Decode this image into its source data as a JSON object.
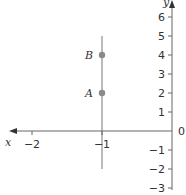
{
  "diagram": {
    "type": "coordinate-plane",
    "axes": {
      "x_label": "x",
      "y_label": "y",
      "origin_label": "0",
      "x_ticks": [
        {
          "value": -2,
          "label": "−2"
        },
        {
          "value": -1,
          "label": "−1"
        }
      ],
      "y_ticks": [
        {
          "value": 6,
          "label": "6"
        },
        {
          "value": 5,
          "label": "5"
        },
        {
          "value": 4,
          "label": "4"
        },
        {
          "value": 3,
          "label": "3"
        },
        {
          "value": 2,
          "label": "2"
        },
        {
          "value": 1,
          "label": "1"
        },
        {
          "value": -1,
          "label": "−1"
        },
        {
          "value": -2,
          "label": "−2"
        },
        {
          "value": -3,
          "label": "−3"
        }
      ]
    },
    "line": {
      "equation": "x = -1",
      "y_from": -2,
      "y_to": 5,
      "color": "#999999"
    },
    "points": [
      {
        "label": "A",
        "x": -1,
        "y": 2,
        "color": "#8a8a8a"
      },
      {
        "label": "B",
        "x": -1,
        "y": 4,
        "color": "#8a8a8a"
      }
    ],
    "axis_color": "#555555"
  }
}
